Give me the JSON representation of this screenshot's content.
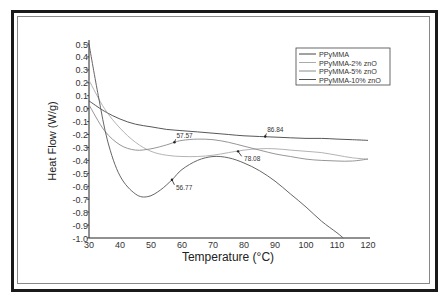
{
  "chart_data": {
    "type": "line",
    "title": "",
    "xlabel": "Temperature (°C)",
    "ylabel": "Heat Flow (W/g)",
    "xlim": [
      30,
      120
    ],
    "ylim": [
      -1.0,
      0.5
    ],
    "xticks": [
      "30",
      "40",
      "50",
      "60",
      "70",
      "80",
      "90",
      "100",
      "110",
      "120"
    ],
    "yticks": [
      "0.5",
      "0.4",
      "0.3",
      "0.2",
      "0.1",
      "0.0",
      "-0.1",
      "-0.2",
      "-0.3",
      "-0.4",
      "-0.5",
      "-0.6",
      "-0.7",
      "-0.8",
      "-0.9",
      "-1.0"
    ],
    "grid": false,
    "legend_position": "top-right",
    "series": [
      {
        "name": "PPyMMA",
        "color": "#444444",
        "x": [
          30,
          35,
          40,
          45,
          50,
          55,
          60,
          65,
          70,
          75,
          80,
          85,
          90,
          95,
          100,
          105,
          110,
          115,
          120
        ],
        "y": [
          0.06,
          -0.02,
          -0.08,
          -0.12,
          -0.14,
          -0.16,
          -0.17,
          -0.18,
          -0.19,
          -0.2,
          -0.21,
          -0.215,
          -0.22,
          -0.225,
          -0.23,
          -0.23,
          -0.235,
          -0.24,
          -0.245
        ]
      },
      {
        "name": "PPyMMA-2% znO",
        "color": "#aaaaaa",
        "x": [
          30,
          35,
          40,
          45,
          50,
          55,
          60,
          65,
          70,
          75,
          80,
          85,
          90,
          95,
          100,
          105,
          110,
          115,
          120
        ],
        "y": [
          0.22,
          0.0,
          -0.15,
          -0.26,
          -0.33,
          -0.36,
          -0.37,
          -0.37,
          -0.36,
          -0.34,
          -0.32,
          -0.31,
          -0.31,
          -0.32,
          -0.33,
          -0.34,
          -0.36,
          -0.38,
          -0.39
        ]
      },
      {
        "name": "PPyMMA-5%  znO",
        "color": "#8a8a8a",
        "x": [
          30,
          35,
          40,
          45,
          50,
          55,
          57.57,
          60,
          65,
          70,
          75,
          80,
          85,
          90,
          95,
          100,
          105,
          110,
          115,
          120
        ],
        "y": [
          0.03,
          -0.17,
          -0.28,
          -0.32,
          -0.31,
          -0.28,
          -0.26,
          -0.245,
          -0.235,
          -0.24,
          -0.26,
          -0.29,
          -0.32,
          -0.35,
          -0.37,
          -0.39,
          -0.4,
          -0.405,
          -0.405,
          -0.39
        ]
      },
      {
        "name": "PPyMMA-10% znO",
        "color": "#555555",
        "x": [
          30,
          33,
          36,
          40,
          45,
          49,
          53,
          56.77,
          60,
          65,
          70,
          75,
          80,
          85,
          90,
          95,
          100,
          105,
          110,
          112
        ],
        "y": [
          0.5,
          0.1,
          -0.25,
          -0.52,
          -0.66,
          -0.68,
          -0.63,
          -0.55,
          -0.47,
          -0.4,
          -0.37,
          -0.38,
          -0.42,
          -0.48,
          -0.56,
          -0.66,
          -0.76,
          -0.87,
          -0.96,
          -1.0
        ]
      }
    ],
    "annotations": [
      {
        "text": "57.57",
        "x": 57.57,
        "y": -0.26
      },
      {
        "text": "86.84",
        "x": 86.84,
        "y": -0.215
      },
      {
        "text": "78.08",
        "x": 78.08,
        "y": -0.33
      },
      {
        "text": "56.77",
        "x": 56.77,
        "y": -0.55
      }
    ]
  }
}
